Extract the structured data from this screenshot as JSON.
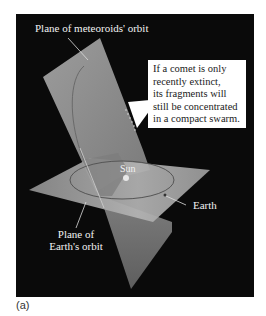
{
  "figure": {
    "caption": "(a)",
    "labels": {
      "meteoroid_plane": "Plane of meteoroids' orbit",
      "sun": "Sun",
      "earth": "Earth",
      "earth_plane_line1": "Plane of",
      "earth_plane_line2": "Earth's orbit"
    },
    "callout": {
      "lines": [
        "If a comet is only",
        "recently extinct,",
        "its fragments will",
        "still be concentrated",
        "in a compact swarm."
      ]
    },
    "colors": {
      "background": "#0a0a0a",
      "vertical_plane": "#8f8f8f",
      "horizontal_plane": "#a8a8a8",
      "orbit_line": "#555555",
      "label_text": "#f2f2f2",
      "callout_bg": "#ffffff"
    }
  }
}
